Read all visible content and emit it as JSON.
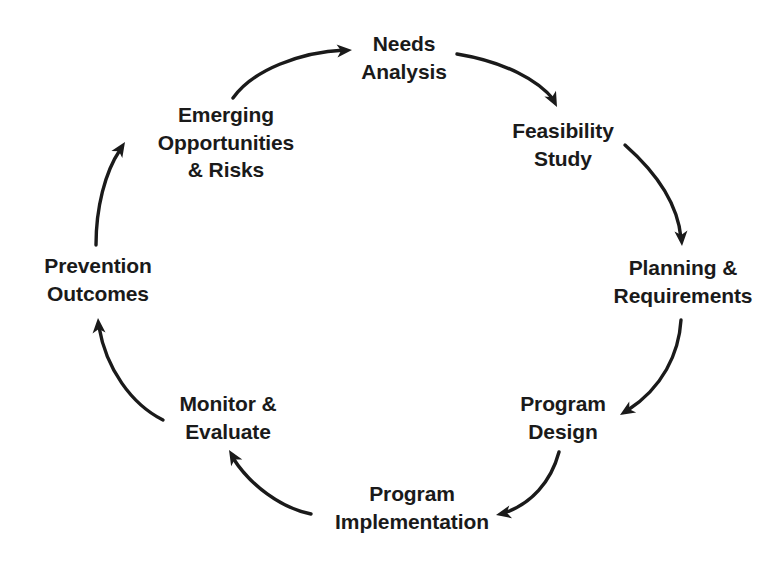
{
  "diagram": {
    "type": "cycle",
    "background_color": "#ffffff",
    "text_color": "#1a1a1a",
    "arrow_color": "#1a1a1a",
    "direction": "clockwise",
    "node_count": 8,
    "nodes": [
      {
        "id": "needs-analysis",
        "label": "Needs\nAnalysis",
        "lines": [
          "Needs",
          "Analysis"
        ],
        "x": 404,
        "y": 58,
        "angle_deg": 90
      },
      {
        "id": "feasibility-study",
        "label": "Feasibility\nStudy",
        "lines": [
          "Feasibility",
          "Study"
        ],
        "x": 563,
        "y": 145,
        "angle_deg": 45
      },
      {
        "id": "planning-requirements",
        "label": "Planning &\nRequirements",
        "lines": [
          "Planning &",
          "Requirements"
        ],
        "x": 683,
        "y": 282,
        "angle_deg": 0
      },
      {
        "id": "program-design",
        "label": "Program\nDesign",
        "lines": [
          "Program",
          "Design"
        ],
        "x": 563,
        "y": 418,
        "angle_deg": -45
      },
      {
        "id": "program-implementation",
        "label": "Program\nImplementation",
        "lines": [
          "Program",
          "Implementation"
        ],
        "x": 412,
        "y": 508,
        "angle_deg": -90
      },
      {
        "id": "monitor-evaluate",
        "label": "Monitor &\nEvaluate",
        "lines": [
          "Monitor &",
          "Evaluate"
        ],
        "x": 228,
        "y": 418,
        "angle_deg": -135
      },
      {
        "id": "prevention-outcomes",
        "label": "Prevention\nOutcomes",
        "lines": [
          "Prevention",
          "Outcomes"
        ],
        "x": 98,
        "y": 280,
        "angle_deg": 180
      },
      {
        "id": "emerging-opportunities-risks",
        "label": "Emerging\nOpportunities\n& Risks",
        "lines": [
          "Emerging",
          "Opportunities",
          "& Risks"
        ],
        "x": 226,
        "y": 143,
        "angle_deg": 135
      }
    ],
    "arrows": [
      {
        "id": "arrow-emerging-to-needs",
        "from": "emerging-opportunities-risks",
        "to": "needs-analysis",
        "path": "M 233,98 C 253,70 300,52 345,50",
        "head_x": 352,
        "head_y": 50,
        "head_angle_deg": 356
      },
      {
        "id": "arrow-needs-to-feasibility",
        "from": "needs-analysis",
        "to": "feasibility-study",
        "path": "M 457,54 C 505,62 538,80 554,100",
        "head_x": 557,
        "head_y": 107,
        "head_angle_deg": 63
      },
      {
        "id": "arrow-feasibility-to-planning",
        "from": "feasibility-study",
        "to": "planning-requirements",
        "path": "M 625,145 C 659,175 678,206 681,238",
        "head_x": 682,
        "head_y": 246,
        "head_angle_deg": 86
      },
      {
        "id": "arrow-planning-to-design",
        "from": "planning-requirements",
        "to": "program-design",
        "path": "M 681,320 C 679,354 662,388 628,410",
        "head_x": 620,
        "head_y": 415,
        "head_angle_deg": 148
      },
      {
        "id": "arrow-design-to-implementation",
        "from": "program-design",
        "to": "program-implementation",
        "path": "M 559,452 C 551,482 531,504 504,513",
        "head_x": 496,
        "head_y": 515,
        "head_angle_deg": 168
      },
      {
        "id": "arrow-implementation-to-monitor",
        "from": "program-implementation",
        "to": "monitor-evaluate",
        "path": "M 311,514 C 281,508 250,485 233,458",
        "head_x": 229,
        "head_y": 450,
        "head_angle_deg": 239
      },
      {
        "id": "arrow-monitor-to-prevention",
        "from": "monitor-evaluate",
        "to": "prevention-outcomes",
        "path": "M 163,420 C 131,404 106,368 99,327",
        "head_x": 98,
        "head_y": 318,
        "head_angle_deg": 266
      },
      {
        "id": "arrow-prevention-to-emerging",
        "from": "prevention-outcomes",
        "to": "emerging-opportunities-risks",
        "path": "M 96,245 C 96,208 105,172 120,150",
        "head_x": 125,
        "head_y": 142,
        "head_angle_deg": 303
      }
    ]
  }
}
